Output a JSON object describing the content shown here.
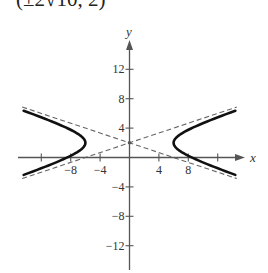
{
  "header": {
    "clipped_label": "(±2√10, 2)"
  },
  "chart_data": {
    "type": "line",
    "title": "",
    "xlabel": "x",
    "ylabel": "y",
    "xlim": [
      -16,
      16
    ],
    "ylim": [
      -15,
      15
    ],
    "x_ticks": [
      -12,
      -8,
      -4,
      4,
      8,
      12
    ],
    "x_tick_labels": [
      "",
      "−8",
      "−4",
      "4",
      "8",
      ""
    ],
    "y_ticks": [
      12,
      8,
      4,
      -4,
      -8,
      -12
    ],
    "y_tick_labels": [
      "12",
      "8",
      "4",
      "−4",
      "−8",
      "−12"
    ],
    "grid": false,
    "legend": null,
    "series": [
      {
        "name": "hyperbola",
        "equation": "x^2/36 - (y-2)^2/4 = 1",
        "style": "solid-thick",
        "center": [
          0,
          2
        ],
        "a": 6,
        "b": 2,
        "vertices": [
          [
            -6,
            2
          ],
          [
            6,
            2
          ]
        ],
        "x_range": [
          -14.4,
          14.4
        ]
      },
      {
        "name": "asymptote-1",
        "equation": "y = 2 + x/3",
        "style": "dashed",
        "x_range": [
          -14.6,
          14.6
        ]
      },
      {
        "name": "asymptote-2",
        "equation": "y = 2 - x/3",
        "style": "dashed",
        "x_range": [
          -14.6,
          14.6
        ]
      }
    ],
    "annotations": [
      {
        "type": "point",
        "at": [
          0,
          2
        ],
        "label": "center"
      }
    ]
  }
}
